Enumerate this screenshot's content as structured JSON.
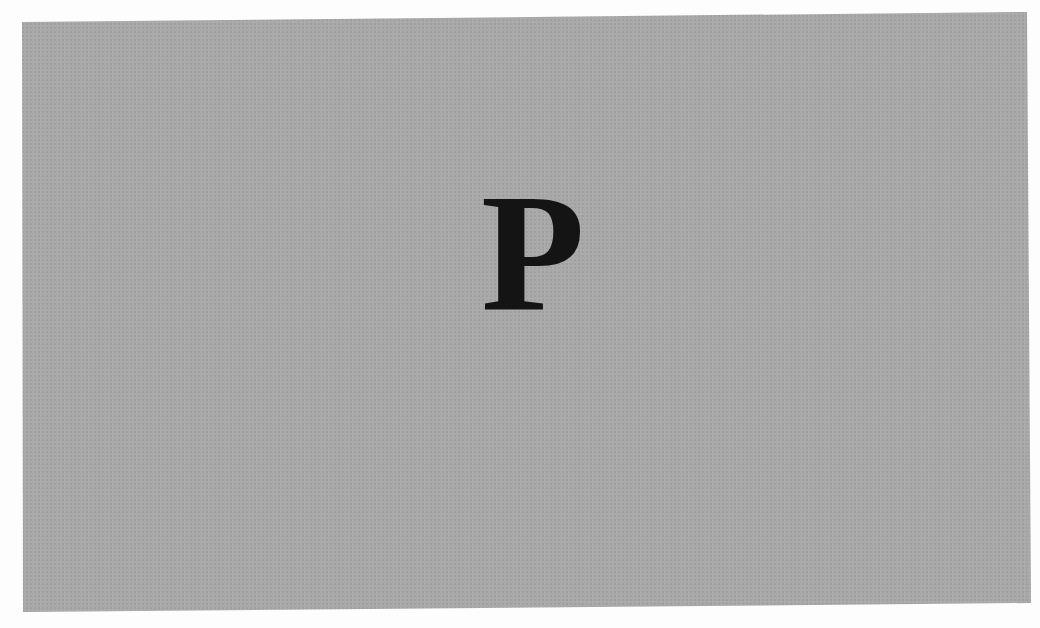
{
  "image": {
    "description": "Scanned grey plate with a single large serif letter",
    "background_color": "#a9a9a9",
    "page_color": "#fdfdfd",
    "letter": {
      "text": "P",
      "color": "#141414"
    }
  }
}
